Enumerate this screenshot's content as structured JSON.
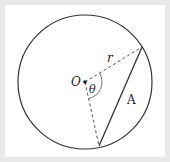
{
  "diagram": {
    "labels": {
      "center": "O",
      "radius": "r",
      "angle": "θ",
      "area": "A"
    },
    "colors": {
      "background_frame": "#e9e9e9",
      "panel": "#ffffff",
      "stroke": "#333333"
    }
  }
}
